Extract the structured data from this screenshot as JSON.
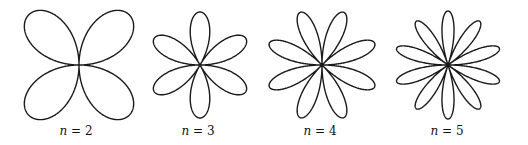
{
  "figure": {
    "stroke_color": "#1a1a1a",
    "background": "#ffffff",
    "panels": [
      {
        "n": 2,
        "label_var": "n",
        "label_eq": " = ",
        "label_val": "2",
        "petals": 4,
        "cx": 79,
        "cy": 65,
        "R": 71,
        "offset_deg": 45,
        "label_x": 76
      },
      {
        "n": 3,
        "label_var": "n",
        "label_eq": " = ",
        "label_val": "3",
        "petals": 6,
        "cx": 200,
        "cy": 65,
        "R": 53,
        "offset_deg": 90,
        "label_x": 198
      },
      {
        "n": 4,
        "label_var": "n",
        "label_eq": " = ",
        "label_val": "4",
        "petals": 8,
        "cx": 322,
        "cy": 65,
        "R": 57,
        "offset_deg": 22.5,
        "label_x": 320
      },
      {
        "n": 5,
        "label_var": "n",
        "label_eq": " = ",
        "label_val": "5",
        "petals": 10,
        "cx": 448,
        "cy": 65,
        "R": 54,
        "offset_deg": 90,
        "label_x": 447
      }
    ]
  }
}
